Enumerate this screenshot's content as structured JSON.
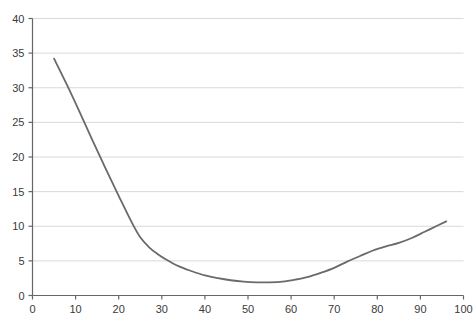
{
  "chart_data": {
    "type": "line",
    "title": "",
    "subtitle": "",
    "xlabel": "",
    "ylabel": "",
    "xlim": [
      0,
      100
    ],
    "ylim": [
      0,
      40
    ],
    "xticks": [
      0,
      10,
      20,
      30,
      40,
      50,
      60,
      70,
      80,
      90,
      100
    ],
    "yticks": [
      0,
      5,
      10,
      15,
      20,
      25,
      30,
      35,
      40
    ],
    "xtick_labels": [
      "0",
      "10",
      "20",
      "30",
      "40",
      "50",
      "60",
      "70",
      "80",
      "90",
      "100"
    ],
    "ytick_labels": [
      "0",
      "5",
      "10",
      "15",
      "20",
      "25",
      "30",
      "35",
      "40"
    ],
    "grid": true,
    "grid_axis": "y",
    "grid_color": "#d9d9d9",
    "axis_color": "#666666",
    "legend": false,
    "legend_position": "none",
    "series": [
      {
        "name": "",
        "color": "#6a6a6a",
        "line_width": 1.8,
        "x": [
          5,
          8,
          11,
          14,
          17,
          20,
          23,
          25,
          27,
          29,
          31,
          34,
          37,
          40,
          43,
          46,
          49,
          52,
          55,
          58,
          61,
          64,
          67,
          70,
          73,
          76,
          79,
          82,
          85,
          88,
          91,
          94,
          96
        ],
        "y": [
          34.2,
          30.4,
          26.4,
          22.3,
          18.3,
          14.4,
          10.6,
          8.4,
          7.0,
          6.0,
          5.2,
          4.2,
          3.5,
          2.9,
          2.5,
          2.2,
          2.0,
          1.9,
          1.9,
          2.0,
          2.3,
          2.7,
          3.3,
          4.0,
          4.9,
          5.7,
          6.5,
          7.1,
          7.6,
          8.3,
          9.2,
          10.1,
          10.7
        ]
      }
    ]
  }
}
